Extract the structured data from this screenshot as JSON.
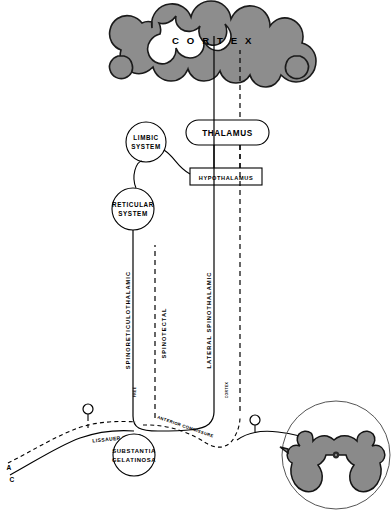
{
  "figure": {
    "colors": {
      "gray_matter": "#8a8a8a",
      "cortex_gyri": "#8d8d8d",
      "stroke": "#000000",
      "background": "#ffffff"
    }
  },
  "cortex": {
    "label": "C O R T E X",
    "plain_label": "CORTEX"
  },
  "nodes": {
    "thalamus": {
      "label": "THALAMUS",
      "shape": "stadium"
    },
    "hypothalamus": {
      "label": "HYPOTHALAMUS",
      "shape": "rectangle"
    },
    "limbic": {
      "line1": "LIMBIC",
      "line2": "SYSTEM",
      "shape": "circle"
    },
    "reticular": {
      "line1": "RETICULAR",
      "line2": "SYSTEM",
      "shape": "circle"
    },
    "substantia": {
      "line1": "SUBSTANTIA",
      "line2": "GELATINOSA",
      "shape": "circle"
    }
  },
  "tracts": [
    {
      "name": "spinoreticulothalamic",
      "label": "SPINORETICULOTHALAMIC",
      "style": "solid"
    },
    {
      "name": "spinotectal",
      "label": "SPINOTECTAL",
      "style": "dashed"
    },
    {
      "name": "lateral-spinothalamic",
      "label": "LATERAL SPINOTHALAMIC",
      "style": "solid"
    }
  ],
  "spinal_labels": {
    "lissauer": "LISSAUER TRACT",
    "anterior_commissure": "ANTERIOR COMMISSURE",
    "small_left": "FREE",
    "small_right": "CORTEX"
  },
  "fibers": [
    {
      "label": "A",
      "style": "dashed"
    },
    {
      "label": "C",
      "style": "solid"
    }
  ],
  "cord_section": {
    "name": "spinal-cord-cross-section",
    "description": "butterfly gray matter"
  }
}
